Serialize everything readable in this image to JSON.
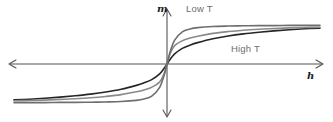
{
  "figure": {
    "name": "magnetization-vs-field-diagram",
    "background_color": "#ffffff"
  },
  "axes": {
    "vertical": {
      "label": "m",
      "name": "magnetization-axis",
      "color": "#545454",
      "x": 167,
      "y_top": 10,
      "y_bottom": 116,
      "arrow_top": true,
      "arrow_bottom": true
    },
    "horizontal": {
      "label": "h",
      "name": "field-axis",
      "color": "#545454",
      "y": 64,
      "x_left": 10,
      "x_right": 322,
      "arrow_left": true,
      "arrow_right": true
    },
    "origin": {
      "x": 167,
      "y": 64
    }
  },
  "annotations": [
    {
      "id": "low-t",
      "text": "Low T",
      "color": "#6e6e6e",
      "x": 186,
      "y": 4
    },
    {
      "id": "high-t",
      "text": "High T",
      "color": "#6e6e6e",
      "x": 231,
      "y": 44
    }
  ],
  "chart_data": {
    "type": "line",
    "title": "",
    "subtitle": "",
    "xlabel": "h",
    "ylabel": "m",
    "xlim": [
      -1,
      1
    ],
    "ylim": [
      -1,
      1
    ],
    "grid": false,
    "legend": "inline-annotations",
    "legend_position": "inline",
    "x": [
      -1.0,
      -0.9,
      -0.8,
      -0.7,
      -0.6,
      -0.5,
      -0.4,
      -0.3,
      -0.2,
      -0.15,
      -0.1,
      -0.05,
      -0.02,
      0.0,
      0.02,
      0.05,
      0.1,
      0.15,
      0.2,
      0.3,
      0.4,
      0.5,
      0.6,
      0.7,
      0.8,
      0.9,
      1.0
    ],
    "series": [
      {
        "name": "Low T",
        "color": "#6e6e6e",
        "width": 1.6,
        "description": "steepest slope near origin, saturates rapidly",
        "values": [
          -0.84,
          -0.84,
          -0.84,
          -0.835,
          -0.835,
          -0.83,
          -0.825,
          -0.815,
          -0.79,
          -0.76,
          -0.7,
          -0.52,
          -0.26,
          0.0,
          0.26,
          0.52,
          0.7,
          0.76,
          0.79,
          0.815,
          0.825,
          0.83,
          0.835,
          0.835,
          0.84,
          0.84,
          0.84
        ]
      },
      {
        "name": "Intermediate T",
        "color": "#8a8a8a",
        "width": 1.6,
        "description": "unlabeled middle curve, intermediate susceptibility",
        "values": [
          -0.8,
          -0.795,
          -0.785,
          -0.77,
          -0.755,
          -0.735,
          -0.705,
          -0.665,
          -0.605,
          -0.565,
          -0.505,
          -0.4,
          -0.22,
          0.0,
          0.22,
          0.4,
          0.505,
          0.565,
          0.605,
          0.665,
          0.705,
          0.735,
          0.755,
          0.77,
          0.785,
          0.795,
          0.8
        ]
      },
      {
        "name": "High T",
        "color": "#262626",
        "width": 1.6,
        "description": "shallowest slope near origin, slowest approach to saturation",
        "values": [
          -0.78,
          -0.765,
          -0.745,
          -0.72,
          -0.69,
          -0.655,
          -0.61,
          -0.55,
          -0.465,
          -0.41,
          -0.34,
          -0.22,
          -0.1,
          0.0,
          0.1,
          0.22,
          0.34,
          0.41,
          0.465,
          0.55,
          0.61,
          0.655,
          0.69,
          0.72,
          0.745,
          0.765,
          0.78
        ]
      }
    ]
  }
}
